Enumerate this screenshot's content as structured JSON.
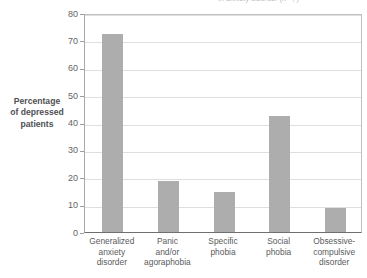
{
  "chart_data": {
    "type": "bar",
    "title": "in anxiety disorder (n=  ,  )",
    "title_clipped": true,
    "categories": [
      "Generalized anxiety disorder",
      "Panic and/or agoraphobia",
      "Specific phobia",
      "Social phobia",
      "Obsessive-compulsive disorder"
    ],
    "category_lines": [
      [
        "Generalized",
        "anxiety",
        "disorder"
      ],
      [
        "Panic",
        "and/or",
        "agoraphobia"
      ],
      [
        "Specific",
        "phobia"
      ],
      [
        "Social",
        "phobia"
      ],
      [
        "Obsessive-",
        "compulsive",
        "disorder"
      ]
    ],
    "values": [
      72.5,
      18.5,
      14.5,
      42.5,
      8.7
    ],
    "xlabel": "",
    "ylabel": "Percentage of depressed patients",
    "ylabel_lines": [
      "Percentage",
      "of depressed",
      "patients"
    ],
    "ylim": [
      0,
      80
    ],
    "ytick_values": [
      0,
      10,
      20,
      30,
      40,
      50,
      60,
      70,
      80
    ],
    "ytick_labels": [
      "0",
      "10",
      "20",
      "30",
      "40",
      "50",
      "60",
      "70",
      "80"
    ],
    "grid": true,
    "legend": false,
    "series_count": 1,
    "colors": {
      "bar": "#adadad",
      "gridline": "#dedfe0",
      "axis": "#6e6f71",
      "text": "#58595b",
      "background": "#ffffff"
    }
  }
}
